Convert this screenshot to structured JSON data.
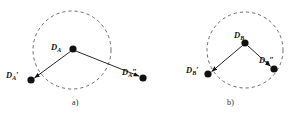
{
  "figure": {
    "background_color": "#ffffff",
    "ink_color": "#111111",
    "dash_color": "#5a5a5a",
    "panels": [
      {
        "id": "a",
        "caption": "a)",
        "circle": {
          "cx": 72,
          "cy": 50,
          "r": 39,
          "style": "dashed"
        },
        "nodes": [
          {
            "id": "da",
            "label_main": "D",
            "label_sub": "A",
            "label_prime": "",
            "label_text": "D_A",
            "x": 73,
            "y": 49,
            "radius": 3.6,
            "inside_circle": true
          },
          {
            "id": "da-prime",
            "label_main": "D",
            "label_sub": "A",
            "label_prime": "′",
            "label_text": "D_A'",
            "x": 31,
            "y": 80,
            "radius": 3.6,
            "inside_circle": false
          },
          {
            "id": "da-double-prime",
            "label_main": "D",
            "label_sub": "A",
            "label_prime": "″",
            "label_text": "D_A''",
            "x": 143,
            "y": 78,
            "radius": 3.6,
            "inside_circle": false
          }
        ],
        "arrows": [
          {
            "id": "arrow-da-to-da-prime",
            "from": "da",
            "to": "da-prime"
          },
          {
            "id": "arrow-da-to-da-double-prime",
            "from": "da",
            "to": "da-double-prime"
          }
        ]
      },
      {
        "id": "b",
        "caption": "b)",
        "circle": {
          "cx": 245,
          "cy": 50,
          "r": 38,
          "style": "dashed"
        },
        "nodes": [
          {
            "id": "db",
            "label_main": "D",
            "label_sub": "B",
            "label_prime": "",
            "label_text": "D_B",
            "x": 245,
            "y": 43,
            "radius": 3.6,
            "inside_circle": true
          },
          {
            "id": "db-prime",
            "label_main": "D",
            "label_sub": "B",
            "label_prime": "′",
            "label_text": "D_B'",
            "x": 208,
            "y": 74,
            "radius": 3.6,
            "inside_circle": true
          },
          {
            "id": "db-double-prime",
            "label_main": "D",
            "label_sub": "B",
            "label_prime": "″",
            "label_text": "D_B''",
            "x": 274,
            "y": 69,
            "radius": 3.6,
            "inside_circle": true
          }
        ],
        "arrows": [
          {
            "id": "arrow-db-to-db-prime",
            "from": "db",
            "to": "db-prime"
          },
          {
            "id": "arrow-db-to-db-double-prime",
            "from": "db",
            "to": "db-double-prime"
          }
        ]
      }
    ]
  }
}
